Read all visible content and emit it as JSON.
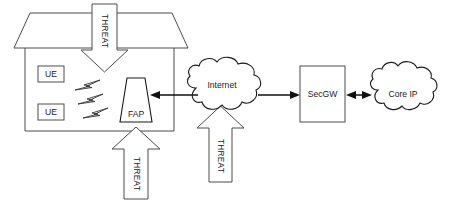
{
  "diagram": {
    "type": "network-security-topology",
    "background_color": "#ffffff",
    "stroke_color": "#4d4d4d",
    "text_color": "#1a1a1a",
    "nodes": {
      "house": {
        "label": "",
        "name": "subscriber-premises"
      },
      "ue_1": {
        "label": "UE"
      },
      "ue_2": {
        "label": "UE"
      },
      "fap": {
        "label": "FAP"
      },
      "internet": {
        "label": "Internet"
      },
      "secgw": {
        "label": "SecGW"
      },
      "core_ip": {
        "label": "Core IP"
      }
    },
    "threat_arrows": [
      {
        "label": "THREAT",
        "direction": "down",
        "target": "house-roof"
      },
      {
        "label": "THREAT",
        "direction": "up",
        "target": "fap"
      },
      {
        "label": "THREAT",
        "direction": "up",
        "target": "internet"
      }
    ],
    "connections": [
      {
        "from": "internet",
        "to": "fap",
        "direction": "left"
      },
      {
        "from": "internet",
        "to": "secgw",
        "direction": "right"
      },
      {
        "from": "secgw",
        "to": "core_ip",
        "direction": "both"
      }
    ],
    "wireless_signals": {
      "count": 3,
      "name": "lightning-bolt"
    }
  }
}
